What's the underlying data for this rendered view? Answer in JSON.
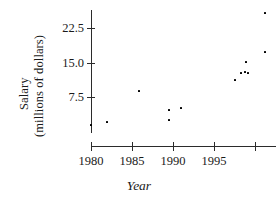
{
  "axes": {
    "y_title_line1": "Salary",
    "y_title_line2": "(millions of dollars)",
    "x_title": "Year"
  },
  "chart_data": {
    "type": "scatter",
    "title": "",
    "xlabel": "Year",
    "ylabel": "Salary (millions of dollars)",
    "xlim": [
      1979,
      2000.5
    ],
    "ylim": [
      0,
      26
    ],
    "grid": false,
    "legend": null,
    "x_ticks": [
      {
        "value": 1980,
        "label": "1980"
      },
      {
        "value": 1985,
        "label": "1985"
      },
      {
        "value": 1990,
        "label": "1990"
      },
      {
        "value": 1995,
        "label": "1995"
      },
      {
        "value": 2000,
        "label": ""
      }
    ],
    "y_ticks": [
      {
        "value": 7.5,
        "label": "7.5"
      },
      {
        "value": 15.0,
        "label": "15.0"
      },
      {
        "value": 22.5,
        "label": "22.5"
      }
    ],
    "points": [
      {
        "x": 1980,
        "y": 1.5,
        "px": 91,
        "py": 125
      },
      {
        "x": 1982,
        "y": 2.1,
        "px": 107,
        "py": 122
      },
      {
        "x": 1986,
        "y": 8.7,
        "px": 139,
        "py": 91
      },
      {
        "x": 1990,
        "y": 4.8,
        "px": 169,
        "py": 110
      },
      {
        "x": 1990,
        "y": 2.6,
        "px": 169,
        "py": 120
      },
      {
        "x": 1991,
        "y": 5.2,
        "px": 181,
        "py": 108
      },
      {
        "x": 1997,
        "y": 11.5,
        "px": 235,
        "py": 80
      },
      {
        "x": 1998,
        "y": 13.0,
        "px": 241,
        "py": 73
      },
      {
        "x": 1999,
        "y": 13.2,
        "px": 245,
        "py": 72
      },
      {
        "x": 1999,
        "y": 13.0,
        "px": 248,
        "py": 73
      },
      {
        "x": 1999,
        "y": 14.6,
        "px": 246,
        "py": 62
      },
      {
        "x": 2000,
        "y": 17.6,
        "px": 265,
        "py": 52
      },
      {
        "x": 2000,
        "y": 25.0,
        "px": 265,
        "py": 13
      }
    ]
  },
  "tick_positions": {
    "y_px": [
      {
        "label": "22.5",
        "top": 28
      },
      {
        "label": "15.0",
        "top": 63
      },
      {
        "label": "7.5",
        "top": 97
      }
    ],
    "x_px": [
      {
        "label": "1980",
        "left": 91
      },
      {
        "label": "1985",
        "left": 132
      },
      {
        "label": "1990",
        "left": 173
      },
      {
        "label": "1995",
        "left": 214
      },
      {
        "label": "",
        "left": 255
      }
    ]
  }
}
